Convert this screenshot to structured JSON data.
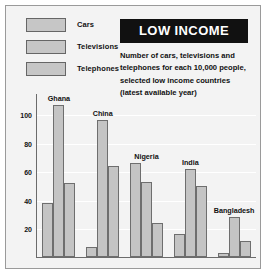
{
  "title": {
    "banner": "LOW INCOME",
    "description": "Number of cars, televisions and telephones for each 10,000 people, selected low income countries (latest available year)"
  },
  "legend": {
    "items": [
      {
        "label": "Cars"
      },
      {
        "label": "Televisions"
      },
      {
        "label": "Telephones"
      }
    ]
  },
  "colors": {
    "bar_fill": "#c4c4c4",
    "bar_stroke": "#6e6e6e",
    "plot_background": "#f3f3f3",
    "banner_background": "#111111",
    "banner_text": "#ffffff"
  },
  "chart_data": {
    "type": "bar",
    "title": "LOW INCOME",
    "subtitle": "Number of cars, televisions and telephones for each 10,000 people, selected low income countries (latest available year)",
    "xlabel": "",
    "ylabel": "",
    "categories": [
      "Ghana",
      "China",
      "Nigeria",
      "India",
      "Bangladesh"
    ],
    "series": [
      {
        "name": "Cars",
        "values": [
          38,
          7,
          66,
          16,
          3
        ]
      },
      {
        "name": "Televisions",
        "values": [
          107,
          97,
          53,
          62,
          28
        ]
      },
      {
        "name": "Telephones",
        "values": [
          52,
          64,
          24,
          50,
          11
        ]
      }
    ],
    "ylim": [
      0,
      115
    ],
    "yticks": [
      20,
      40,
      60,
      80,
      100
    ],
    "ytick_labels": [
      "20",
      "40",
      "60",
      "80",
      "100"
    ],
    "grid": true,
    "legend_position": "top-left"
  }
}
